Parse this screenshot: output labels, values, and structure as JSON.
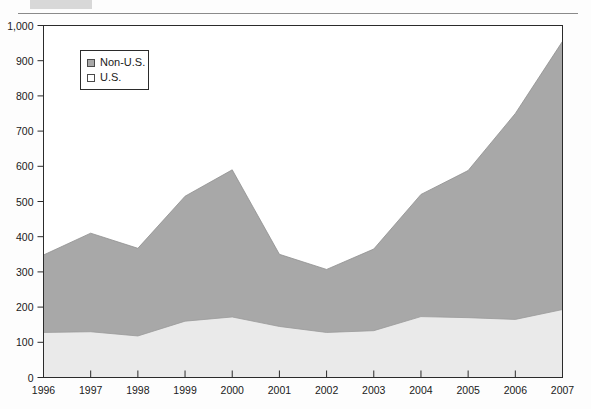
{
  "figure": {
    "background_color": "#fdfdfd",
    "plot_border_color": "#2b2b2b",
    "top_rule_color": "#8a8a8a"
  },
  "legend": {
    "position": "top-left-inside",
    "entries": [
      {
        "label": "Non-U.S.",
        "swatch": "filled-gray-square",
        "color": "#a8a8a8"
      },
      {
        "label": "U.S.",
        "swatch": "empty-white-square",
        "color": "#eaeaea"
      }
    ]
  },
  "axis": {
    "y_ticks": [
      "0",
      "100",
      "200",
      "300",
      "400",
      "500",
      "600",
      "700",
      "800",
      "900",
      "1,000"
    ],
    "x_ticks": [
      "1996",
      "1997",
      "1998",
      "1999",
      "2000",
      "2001",
      "2002",
      "2003",
      "2004",
      "2005",
      "2006",
      "2007"
    ]
  },
  "chart_data": {
    "type": "area",
    "stacked": true,
    "title": "",
    "subtitle": "",
    "xlabel": "",
    "ylabel": "",
    "categories": [
      "1996",
      "1997",
      "1998",
      "1999",
      "2000",
      "2001",
      "2002",
      "2003",
      "2004",
      "2005",
      "2006",
      "2007"
    ],
    "series": [
      {
        "name": "U.S.",
        "color": "#eaeaea",
        "values": [
          128,
          130,
          118,
          160,
          172,
          145,
          128,
          133,
          173,
          170,
          165,
          193
        ]
      },
      {
        "name": "Non-U.S.",
        "color": "#a8a8a8",
        "values": [
          220,
          280,
          249,
          355,
          418,
          205,
          179,
          232,
          347,
          418,
          585,
          762
        ]
      }
    ],
    "totals": [
      348,
      410,
      367,
      515,
      590,
      350,
      307,
      365,
      520,
      588,
      750,
      955
    ],
    "ylim": [
      0,
      1000
    ],
    "ytick_step": 100,
    "grid": false,
    "legend_position": "top-left"
  }
}
